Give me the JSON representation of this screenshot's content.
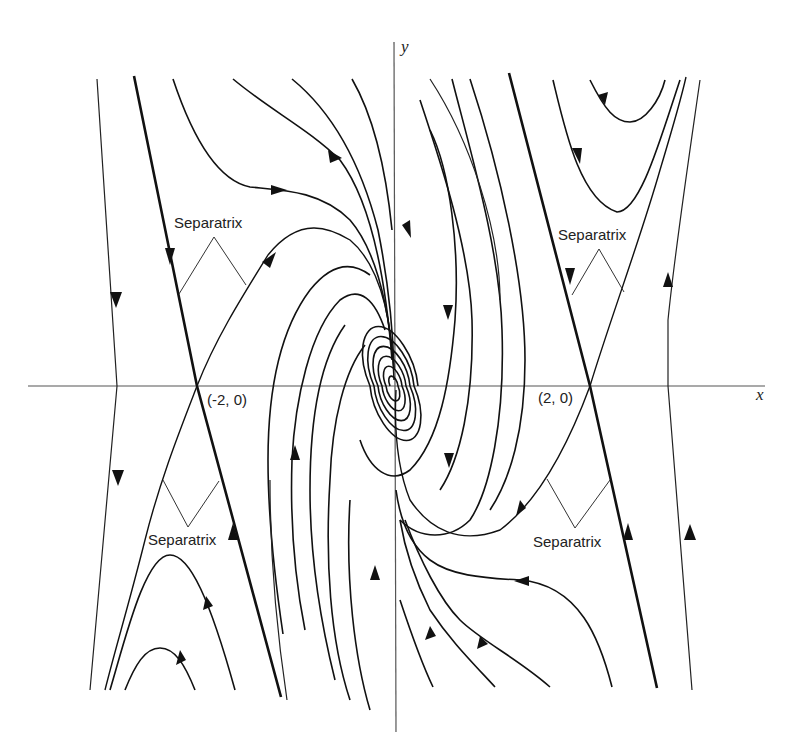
{
  "figure": {
    "axes": {
      "x_label": "x",
      "y_label": "y"
    },
    "equilibria": [
      {
        "label": "(-2, 0)",
        "type": "saddle"
      },
      {
        "label": "(2, 0)",
        "type": "saddle"
      },
      {
        "label": "",
        "type": "stable-spiral",
        "location": "origin"
      }
    ],
    "annotations": [
      {
        "text": "Separatrix",
        "position": "upper-left"
      },
      {
        "text": "Separatrix",
        "position": "upper-right"
      },
      {
        "text": "Separatrix",
        "position": "lower-left"
      },
      {
        "text": "Separatrix",
        "position": "lower-right"
      }
    ]
  }
}
